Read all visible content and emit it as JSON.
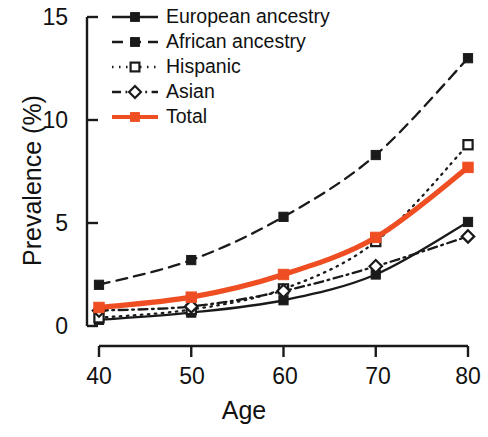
{
  "chart_data": {
    "type": "line",
    "title": "",
    "xlabel": "Age",
    "ylabel": "Prevalence (%)",
    "x": [
      40,
      50,
      60,
      70,
      80
    ],
    "xtick_labels": [
      "40",
      "50",
      "60",
      "70",
      "80"
    ],
    "ytick_labels": [
      "0",
      "5",
      "10",
      "15"
    ],
    "yticks": [
      0,
      5,
      10,
      15
    ],
    "xlim": [
      40,
      80
    ],
    "ylim": [
      0,
      15
    ],
    "grid": false,
    "legend_position": "top-left-inside",
    "series": [
      {
        "name": "European ancestry",
        "values": [
          0.3,
          0.65,
          1.25,
          2.5,
          5.05
        ],
        "color": "#1a1a1a",
        "line_style": "solid",
        "marker": "filled-square"
      },
      {
        "name": "African ancestry",
        "values": [
          2.0,
          3.2,
          5.3,
          8.3,
          13.0
        ],
        "color": "#1a1a1a",
        "line_style": "dashed",
        "marker": "filled-square"
      },
      {
        "name": "Hispanic",
        "values": [
          0.4,
          0.8,
          1.8,
          4.1,
          8.8
        ],
        "color": "#1a1a1a",
        "line_style": "dotted",
        "marker": "open-square"
      },
      {
        "name": "Asian",
        "values": [
          0.75,
          0.95,
          1.7,
          2.9,
          4.35
        ],
        "color": "#1a1a1a",
        "line_style": "dash-dot",
        "marker": "open-diamond"
      },
      {
        "name": "Total",
        "values": [
          0.9,
          1.4,
          2.5,
          4.3,
          7.7
        ],
        "color": "#ef4e23",
        "line_style": "solid",
        "marker": "filled-square"
      }
    ]
  },
  "legend": {
    "items": [
      {
        "label": "European ancestry"
      },
      {
        "label": "African ancestry"
      },
      {
        "label": "Hispanic"
      },
      {
        "label": "Asian"
      },
      {
        "label": "Total"
      }
    ]
  },
  "axes": {
    "y_title": "Prevalence (%)",
    "x_title": "Age",
    "y_ticks": [
      "15",
      "10",
      "5",
      "0"
    ],
    "x_ticks": [
      "40",
      "50",
      "60",
      "70",
      "80"
    ]
  },
  "colors": {
    "accent": "#ef4e23",
    "ink": "#1a1a1a",
    "background": "#ffffff"
  }
}
